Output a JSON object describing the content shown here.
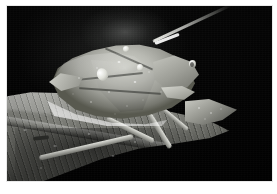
{
  "photo": {
    "subject": "Green stink bug (shield bug) resting on a leaf",
    "alt_text": "Close-up macro photograph of a pale green shield bug perched on the edge of a broad leaf against a black background",
    "orientation": "landscape",
    "border_color": "#ffffff",
    "background_color": "#040404",
    "palette": {
      "background": "#040404",
      "halo_glow": "#969896",
      "bug_body_light": "#d2d3cc",
      "bug_body_mid": "#9a9b94",
      "bug_body_shadow": "#58594f",
      "leaf_light": "#a9aaa4",
      "leaf_mid": "#74756f",
      "leaf_dark": "#2a2b28",
      "highlight": "#ffffff"
    },
    "elements": {
      "bug_label": "shield-bug",
      "leaf_label": "leaf",
      "antenna_label": "antenna",
      "eye_label": "compound-eye",
      "legs_label": "legs",
      "background_label": "dark-background",
      "halo_label": "background-glow"
    }
  }
}
